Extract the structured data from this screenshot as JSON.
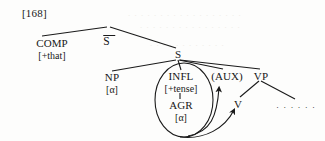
{
  "figure": {
    "example_number": "[168]",
    "type": "syntax-tree",
    "ink_color": "#1a1a1a",
    "background_color": "#fdfdfc"
  },
  "nodes": {
    "sbar": {
      "label": "S",
      "overbar": true
    },
    "comp": {
      "label": "COMP",
      "feature": "[+that]"
    },
    "s": {
      "label": "S"
    },
    "np": {
      "label": "NP",
      "feature": "[α]"
    },
    "infl": {
      "label": "INFL",
      "feature": "[+tense]"
    },
    "agr": {
      "label": "AGR",
      "feature": "[α]"
    },
    "aux": {
      "label": "(AUX)"
    },
    "vp": {
      "label": "VP"
    },
    "v": {
      "label": "V"
    },
    "ellipsis": {
      "label": "· · · · · ·"
    }
  },
  "annotations": {
    "circle_label": "INFL-AGR constituent circled",
    "arrow_to_aux": "movement arrow to (AUX)",
    "arrow_to_v": "movement arrow to V"
  }
}
